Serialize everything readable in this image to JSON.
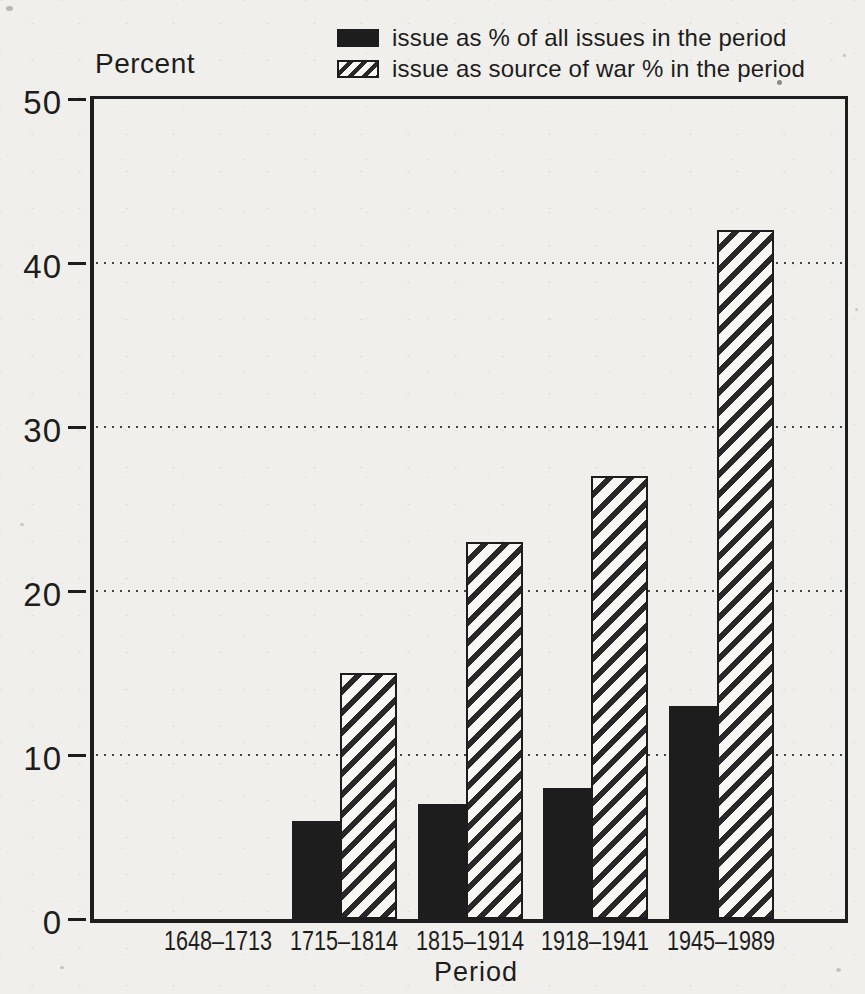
{
  "page": {
    "background": "#f0efeb",
    "ink": "#1d1d1d",
    "paper_fill": "#f8f7f3"
  },
  "chart_data": {
    "type": "bar",
    "title": "",
    "ylabel": "Percent",
    "xlabel": "Period",
    "ylim": [
      0,
      50
    ],
    "yticks": [
      0,
      10,
      20,
      30,
      40,
      50
    ],
    "grid": "dotted horizontal gridlines at 10, 20, 30, 40",
    "legend_position": "top",
    "categories": [
      "1648–1713",
      "1715–1814",
      "1815–1914",
      "1918–1941",
      "1945–1989"
    ],
    "series": [
      {
        "name": "issue as % of all issues in the period",
        "style": "solid-black",
        "values": [
          0,
          6,
          7,
          8,
          13
        ]
      },
      {
        "name": "issue as source of war % in the period",
        "style": "diagonal-hatch",
        "values": [
          0,
          15,
          23,
          27,
          42
        ]
      }
    ]
  }
}
